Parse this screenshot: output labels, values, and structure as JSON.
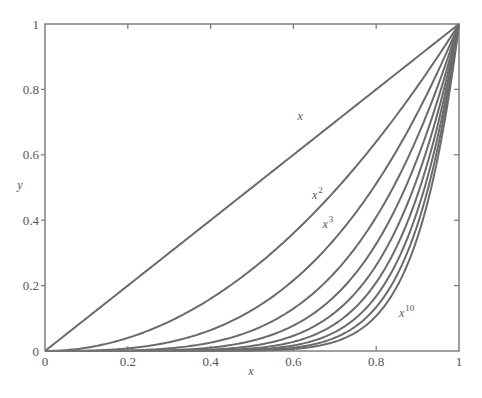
{
  "chart_data": {
    "type": "line",
    "title": "",
    "xlabel": "x",
    "ylabel": "y",
    "xlim": [
      0,
      1
    ],
    "ylim": [
      0,
      1
    ],
    "grid": false,
    "legend": "none (inline curve labels)",
    "x_ticks": [
      {
        "value": 0,
        "label": "0"
      },
      {
        "value": 0.2,
        "label": "0.2"
      },
      {
        "value": 0.4,
        "label": "0.4"
      },
      {
        "value": 0.6,
        "label": "0.6"
      },
      {
        "value": 0.8,
        "label": "0.8"
      },
      {
        "value": 1,
        "label": "1"
      }
    ],
    "y_ticks": [
      {
        "value": 0,
        "label": "0"
      },
      {
        "value": 0.2,
        "label": "0.2"
      },
      {
        "value": 0.4,
        "label": "0.4"
      },
      {
        "value": 0.6,
        "label": "0.6"
      },
      {
        "value": 0.8,
        "label": "0.8"
      },
      {
        "value": 1,
        "label": "1"
      }
    ],
    "series": [
      {
        "name": "x",
        "exponent": 1
      },
      {
        "name": "x^2",
        "exponent": 2
      },
      {
        "name": "x^3",
        "exponent": 3
      },
      {
        "name": "x^4",
        "exponent": 4
      },
      {
        "name": "x^5",
        "exponent": 5
      },
      {
        "name": "x^6",
        "exponent": 6
      },
      {
        "name": "x^7",
        "exponent": 7
      },
      {
        "name": "x^8",
        "exponent": 8
      },
      {
        "name": "x^9",
        "exponent": 9
      },
      {
        "name": "x^10",
        "exponent": 10
      }
    ],
    "annotations": [
      {
        "base": "x",
        "sup": "",
        "x": 0.61,
        "y": 0.705
      },
      {
        "base": "x",
        "sup": "2",
        "x": 0.645,
        "y": 0.465
      },
      {
        "base": "x",
        "sup": "3",
        "x": 0.67,
        "y": 0.375
      },
      {
        "base": "x",
        "sup": "10",
        "x": 0.855,
        "y": 0.105
      }
    ],
    "line_color": "#6b6b6b",
    "axis_color": "#777777"
  }
}
